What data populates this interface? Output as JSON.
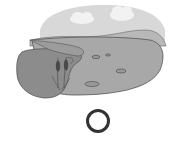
{
  "illustration": {
    "subject": "pond scene",
    "elements": [
      "sky",
      "clouds",
      "far-hill",
      "pond-water",
      "near-bank",
      "cattails",
      "lily-pads"
    ],
    "colors": {
      "sky": "#d8d8d8",
      "cloud": "#f4f4f4",
      "hill": "#b4b4b4",
      "water": "#a9a9a9",
      "bank": "#8c8c8c",
      "outline": "#555555",
      "cattail": "#4a4a4a"
    }
  },
  "option": {
    "type": "radio",
    "selected": false,
    "border_color": "#333333"
  }
}
